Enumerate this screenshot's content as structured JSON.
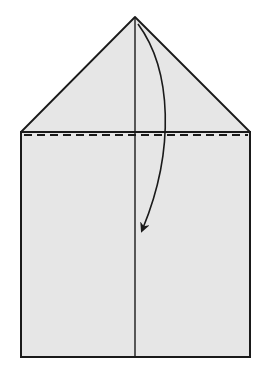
{
  "diagram": {
    "type": "origami-fold-step",
    "colors": {
      "paper": "#e6e6e6",
      "line": "#1a1a1a",
      "background": "#ffffff"
    },
    "shapes": {
      "triangle": {
        "apex": [
          135,
          17
        ],
        "left": [
          21,
          132
        ],
        "right": [
          250,
          132
        ]
      },
      "rectangle": {
        "x": 21,
        "y": 132,
        "width": 229,
        "height": 225
      },
      "center_crease": {
        "x": 135,
        "y1": 17,
        "y2": 357
      },
      "valley_fold_line": {
        "y": 135,
        "x1": 24,
        "x2": 248,
        "style": "dashed"
      },
      "fold_arrow": {
        "from": [
          138,
          24
        ],
        "control": [
          180,
          110
        ],
        "to": [
          142,
          230
        ]
      }
    }
  }
}
